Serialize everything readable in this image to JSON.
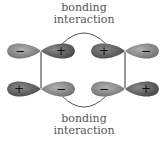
{
  "top_label": {
    "line1": "bonding",
    "line2": "interaction"
  },
  "bottom_label": {
    "line1": "bonding",
    "line2": "interaction"
  },
  "orbitals": {
    "top_left": {
      "left_sign": "−",
      "right_sign": "+"
    },
    "top_right": {
      "left_sign": "+",
      "right_sign": "−"
    },
    "bottom_left": {
      "left_sign": "+",
      "right_sign": "−"
    },
    "bottom_right": {
      "left_sign": "−",
      "right_sign": "+"
    }
  },
  "colors": {
    "dark_lobe": "#6e6e6e",
    "light_lobe": "#9a9a9a",
    "line": "#333333"
  }
}
